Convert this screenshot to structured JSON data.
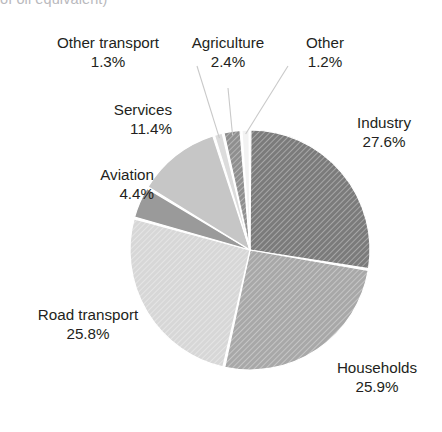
{
  "clipped_caption": "of oil equivalent)",
  "chart_data": {
    "type": "pie",
    "title": "",
    "subtitle": "",
    "xlabel": "",
    "ylabel": "",
    "legend_position": "none",
    "grid": false,
    "total": 100.0,
    "units": "percent",
    "start_angle_deg": 0,
    "direction": "clockwise",
    "categories": [
      "Industry",
      "Households",
      "Road transport",
      "Aviation",
      "Services",
      "Other transport",
      "Agriculture",
      "Other"
    ],
    "values": [
      27.6,
      25.9,
      25.8,
      4.4,
      11.4,
      1.3,
      2.4,
      1.2
    ],
    "slices": [
      {
        "label": "Industry",
        "value": 27.6,
        "value_text": "27.6%",
        "color": "#7b7b7b",
        "hatched": true,
        "label_position": "right",
        "start_deg": 0.0,
        "end_deg": 99.36
      },
      {
        "label": "Households",
        "value": 25.9,
        "value_text": "25.9%",
        "color": "#a8a8a8",
        "hatched": true,
        "label_position": "bottom-right",
        "start_deg": 99.36,
        "end_deg": 192.6
      },
      {
        "label": "Road transport",
        "value": 25.8,
        "value_text": "25.8%",
        "color": "#d7d7d7",
        "hatched": true,
        "label_position": "bottom-left",
        "start_deg": 192.6,
        "end_deg": 285.48
      },
      {
        "label": "Aviation",
        "value": 4.4,
        "value_text": "4.4%",
        "color": "#9a9a9a",
        "hatched": false,
        "label_position": "left",
        "start_deg": 285.48,
        "end_deg": 301.32
      },
      {
        "label": "Services",
        "value": 11.4,
        "value_text": "11.4%",
        "color": "#c6c6c6",
        "hatched": false,
        "label_position": "upper-left",
        "start_deg": 301.32,
        "end_deg": 342.36
      },
      {
        "label": "Other transport",
        "value": 1.3,
        "value_text": "1.3%",
        "color": "#dcdcdc",
        "hatched": false,
        "label_position": "top-left",
        "start_deg": 342.36,
        "end_deg": 347.04
      },
      {
        "label": "Agriculture",
        "value": 2.4,
        "value_text": "2.4%",
        "color": "#8f8f8f",
        "hatched": true,
        "label_position": "top-center",
        "start_deg": 347.04,
        "end_deg": 355.68
      },
      {
        "label": "Other",
        "value": 1.2,
        "value_text": "1.2%",
        "color": "#f2f2f2",
        "hatched": false,
        "label_position": "top-right",
        "start_deg": 355.68,
        "end_deg": 360.0
      }
    ]
  },
  "labels": {
    "other_transport": {
      "name": "Other transport",
      "pct": "1.3%"
    },
    "agriculture": {
      "name": "Agriculture",
      "pct": "2.4%"
    },
    "other": {
      "name": "Other",
      "pct": "1.2%"
    },
    "services": {
      "name": "Services",
      "pct": "11.4%"
    },
    "aviation": {
      "name": "Aviation",
      "pct": "4.4%"
    },
    "road_transport": {
      "name": "Road transport",
      "pct": "25.8%"
    },
    "industry": {
      "name": "Industry",
      "pct": "27.6%"
    },
    "households": {
      "name": "Households",
      "pct": "25.9%"
    }
  },
  "colors": {
    "background": "#ffffff",
    "text": "#231f20",
    "clipped_caption": "#b9b9bd",
    "leader_line": "#c9c9c9",
    "slice_gap": "#ffffff"
  }
}
